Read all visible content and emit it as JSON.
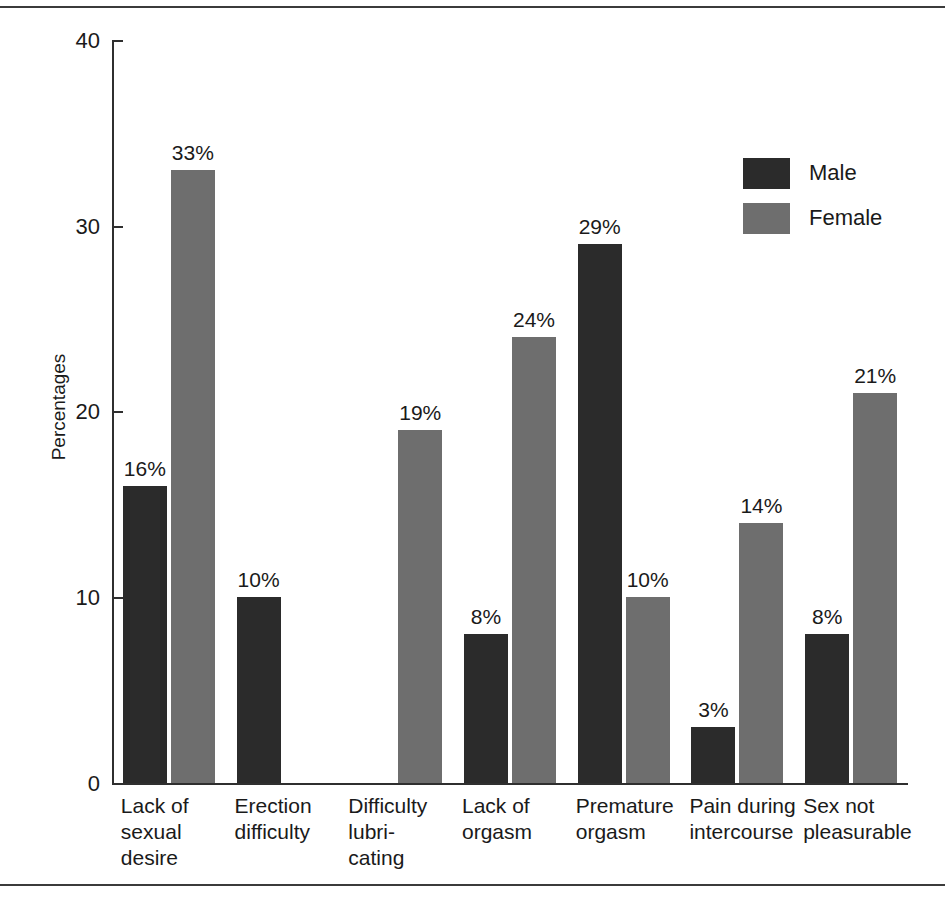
{
  "chart_data": {
    "type": "bar",
    "title": "",
    "subtitle": "",
    "xlabel": "",
    "ylabel": "Percentages",
    "ylim": [
      0,
      40
    ],
    "yticks": [
      0,
      10,
      20,
      30,
      40
    ],
    "ytick_labels": [
      "0",
      "10",
      "20",
      "30",
      "40"
    ],
    "grid": false,
    "legend_position": "top-right",
    "value_suffix": "%",
    "categories": [
      "Lack of\nsexual\ndesire",
      "Erection\ndifficulty",
      "Difficulty\nlubri-\ncating",
      "Lack of\norgasm",
      "Premature\norgasm",
      "Pain during\nintercourse",
      "Sex not\npleasurable"
    ],
    "series": [
      {
        "name": "Male",
        "color": "#2b2b2b",
        "values": [
          16,
          10,
          null,
          8,
          29,
          3,
          8
        ],
        "labels": [
          "16%",
          "10%",
          "",
          "8%",
          "29%",
          "3%",
          "8%"
        ]
      },
      {
        "name": "Female",
        "color": "#6e6e6e",
        "values": [
          33,
          null,
          19,
          24,
          10,
          14,
          21
        ],
        "labels": [
          "33%",
          "",
          "19%",
          "24%",
          "10%",
          "14%",
          "21%"
        ]
      }
    ]
  },
  "legend": {
    "entries": [
      {
        "label": "Male",
        "color": "#2b2b2b"
      },
      {
        "label": "Female",
        "color": "#6e6e6e"
      }
    ]
  },
  "axis": {
    "y_title": "Percentages",
    "y_ticks": [
      "40",
      "30",
      "20",
      "10",
      "0"
    ]
  }
}
